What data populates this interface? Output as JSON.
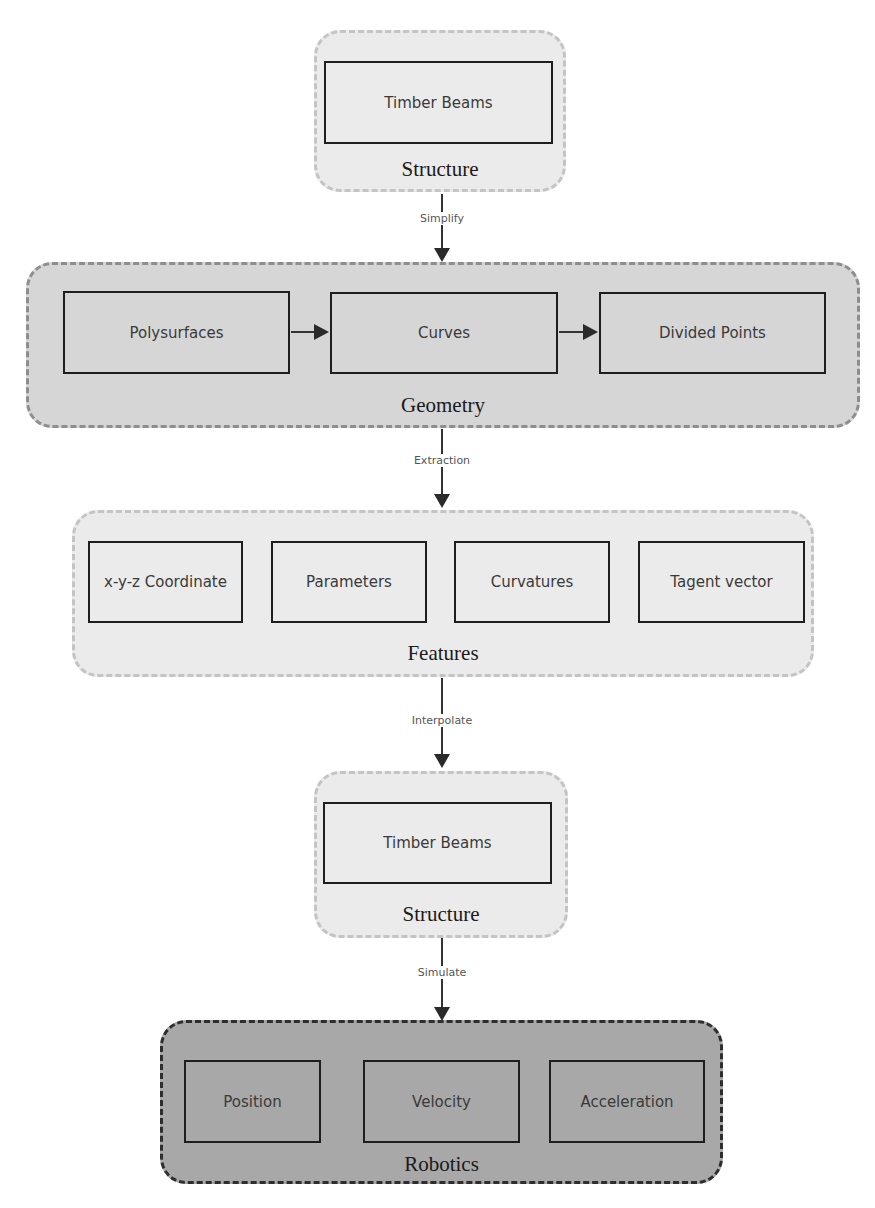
{
  "diagram": {
    "groups": [
      {
        "id": "structure_top",
        "label": "Structure",
        "nodes": [
          "Timber Beams"
        ]
      },
      {
        "id": "geometry",
        "label": "Geometry",
        "nodes": [
          "Polysurfaces",
          "Curves",
          "Divided Points"
        ]
      },
      {
        "id": "features",
        "label": "Features",
        "nodes": [
          "x-y-z Coordinate",
          "Parameters",
          "Curvatures",
          "Tagent vector"
        ]
      },
      {
        "id": "structure_bottom",
        "label": "Structure",
        "nodes": [
          "Timber Beams"
        ]
      },
      {
        "id": "robotics",
        "label": "Robotics",
        "nodes": [
          "Position",
          "Velocity",
          "Acceleration"
        ]
      }
    ],
    "edges": [
      {
        "from": "structure_top",
        "to": "geometry",
        "label": "Simplify"
      },
      {
        "from": "geometry",
        "to": "features",
        "label": "Extraction"
      },
      {
        "from": "features",
        "to": "structure_bottom",
        "label": "Interpolate"
      },
      {
        "from": "structure_bottom",
        "to": "robotics",
        "label": "Simulate"
      }
    ],
    "inner_edges": [
      {
        "from": "Polysurfaces",
        "to": "Curves"
      },
      {
        "from": "Curves",
        "to": "Divided Points"
      }
    ],
    "colors": {
      "light_group": "#ebebeb",
      "mid_group": "#d6d6d6",
      "dark_group": "#a8a8a8",
      "node_border": "#1e1e1e",
      "arrow": "#2a2a2a"
    }
  }
}
